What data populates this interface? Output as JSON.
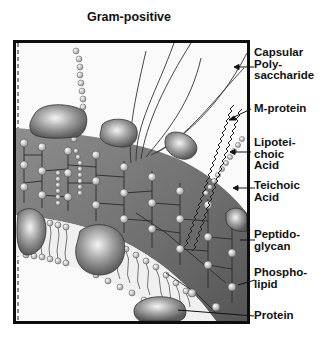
{
  "title": "Gram-positive",
  "labels": [
    {
      "id": "capsular-polysaccharide",
      "text": "Capsular\nPoly-\nsaccharide"
    },
    {
      "id": "m-protein",
      "text": "M-protein"
    },
    {
      "id": "lipoteichoic-acid",
      "text": "Lipotei-\nchoic\nAcid"
    },
    {
      "id": "teichoic-acid",
      "text": "Teichoic\nAcid"
    },
    {
      "id": "peptidoglycan",
      "text": "Peptido-\nglycan"
    },
    {
      "id": "phospholipid",
      "text": "Phospho-\nlipid"
    },
    {
      "id": "protein",
      "text": "Protein"
    }
  ],
  "colors": {
    "frame": "#0d0d0d",
    "peptidoglycan": "#7a7a7a",
    "bead": "#d8d8d8",
    "protein": "#8a8a8a",
    "membrane_bg": "#f4f4f4",
    "text": "#111111"
  }
}
